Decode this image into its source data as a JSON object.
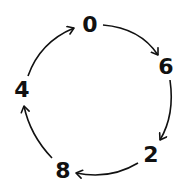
{
  "diagram": {
    "type": "cycle",
    "direction": "clockwise",
    "nodes": [
      {
        "id": "n0",
        "label": "0"
      },
      {
        "id": "n6",
        "label": "6"
      },
      {
        "id": "n2",
        "label": "2"
      },
      {
        "id": "n8",
        "label": "8"
      },
      {
        "id": "n4",
        "label": "4"
      }
    ],
    "edges": [
      {
        "from": "0",
        "to": "6"
      },
      {
        "from": "6",
        "to": "2"
      },
      {
        "from": "2",
        "to": "8"
      },
      {
        "from": "8",
        "to": "4"
      },
      {
        "from": "4",
        "to": "0"
      }
    ],
    "colors": {
      "stroke": "#111111",
      "background": "#ffffff"
    }
  }
}
